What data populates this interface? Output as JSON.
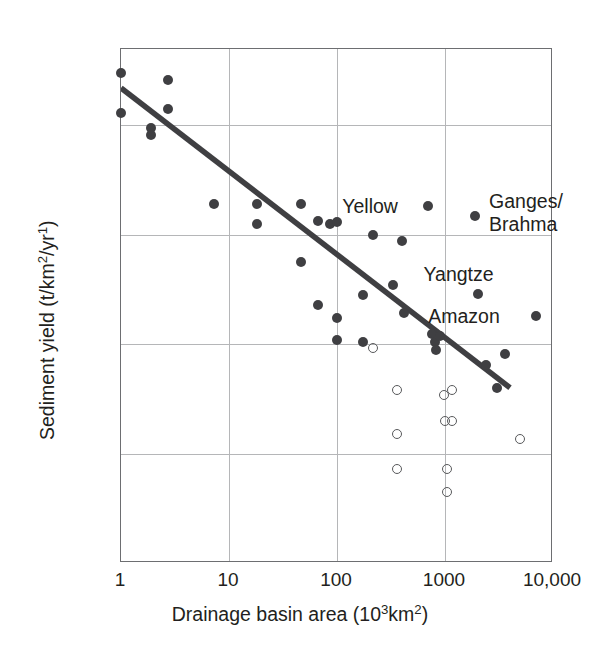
{
  "chart_data": {
    "type": "scatter",
    "title": "",
    "xlabel": "Drainage basin area (10³km²)",
    "ylabel": "Sediment yield (t/km²/yr¹)",
    "xscale": "log",
    "yscale": "log",
    "xlim": [
      1,
      10000
    ],
    "ylim": [
      1,
      50000
    ],
    "grid": true,
    "legend": "none",
    "xticks": [
      {
        "value": 1,
        "label": "1"
      },
      {
        "value": 10,
        "label": "10"
      },
      {
        "value": 100,
        "label": "100"
      },
      {
        "value": 1000,
        "label": "1000"
      },
      {
        "value": 10000,
        "label": "10,000"
      }
    ],
    "yticks": [
      {
        "value": 50000,
        "label": "50,000"
      },
      {
        "value": 10000,
        "label": "10,000"
      },
      {
        "value": 1000,
        "label": "1000"
      },
      {
        "value": 100,
        "label": "100"
      },
      {
        "value": 10,
        "label": "10"
      },
      {
        "value": 1,
        "label": "1"
      }
    ],
    "series": [
      {
        "name": "filled-markers",
        "marker": "filled-circle",
        "color": "#3f3f42",
        "points": [
          {
            "x": 1.0,
            "y": 30000
          },
          {
            "x": 1.0,
            "y": 13000
          },
          {
            "x": 1.9,
            "y": 9400
          },
          {
            "x": 1.9,
            "y": 8200
          },
          {
            "x": 2.7,
            "y": 26000
          },
          {
            "x": 2.7,
            "y": 14000
          },
          {
            "x": 7.2,
            "y": 1900
          },
          {
            "x": 18,
            "y": 1900
          },
          {
            "x": 18,
            "y": 1250
          },
          {
            "x": 46,
            "y": 1900
          },
          {
            "x": 46,
            "y": 560
          },
          {
            "x": 66,
            "y": 1350
          },
          {
            "x": 66,
            "y": 230
          },
          {
            "x": 86,
            "y": 1250
          },
          {
            "x": 100,
            "y": 1300
          },
          {
            "x": 100,
            "y": 175
          },
          {
            "x": 100,
            "y": 110
          },
          {
            "x": 175,
            "y": 280
          },
          {
            "x": 175,
            "y": 105
          },
          {
            "x": 215,
            "y": 1000
          },
          {
            "x": 330,
            "y": 350
          },
          {
            "x": 400,
            "y": 880
          },
          {
            "x": 420,
            "y": 195
          },
          {
            "x": 700,
            "y": 1850
          },
          {
            "x": 760,
            "y": 125
          },
          {
            "x": 800,
            "y": 105
          },
          {
            "x": 830,
            "y": 88
          },
          {
            "x": 900,
            "y": 120
          },
          {
            "x": 1900,
            "y": 1500
          },
          {
            "x": 2000,
            "y": 290
          },
          {
            "x": 2400,
            "y": 65
          },
          {
            "x": 3000,
            "y": 40
          },
          {
            "x": 3600,
            "y": 82
          },
          {
            "x": 7000,
            "y": 180
          }
        ]
      },
      {
        "name": "open-markers",
        "marker": "open-circle",
        "color": "#58595b",
        "points": [
          {
            "x": 215,
            "y": 92
          },
          {
            "x": 360,
            "y": 38
          },
          {
            "x": 360,
            "y": 15
          },
          {
            "x": 360,
            "y": 7.2
          },
          {
            "x": 980,
            "y": 34
          },
          {
            "x": 1150,
            "y": 38
          },
          {
            "x": 1000,
            "y": 20
          },
          {
            "x": 1150,
            "y": 20
          },
          {
            "x": 1050,
            "y": 7.3
          },
          {
            "x": 1050,
            "y": 4.5
          },
          {
            "x": 5000,
            "y": 13.5
          }
        ]
      }
    ],
    "trendline": {
      "name": "regression-line",
      "color": "#3f3f42",
      "from": {
        "x": 1,
        "y": 22000
      },
      "to": {
        "x": 4000,
        "y": 40
      }
    },
    "annotations": [
      {
        "id": "yellow",
        "text": "Yellow",
        "x": 700,
        "y": 1850
      },
      {
        "id": "ganges-brahma",
        "text": "Ganges/",
        "x": 1900,
        "y": 1500
      },
      {
        "id": "brahma",
        "text": "Brahma",
        "x": 1900,
        "y": 1500
      },
      {
        "id": "yangtze",
        "text": "Yangtze",
        "x": 2000,
        "y": 290
      },
      {
        "id": "amazon",
        "text": "Amazon",
        "x": 7000,
        "y": 180
      }
    ]
  },
  "labels": {
    "yellow": "Yellow",
    "ganges": "Ganges/",
    "brahma": "Brahma",
    "yangtze": "Yangtze",
    "amazon": "Amazon"
  },
  "axis": {
    "x_title_main": "Drainage basin area (10",
    "x_title_sup": "3",
    "x_title_tail": "km",
    "x_title_sup2": "2",
    "x_title_close": ")",
    "y_title_main": "Sediment yield (t/km",
    "y_title_sup": "2",
    "y_title_mid": "/yr",
    "y_title_sup2": "1",
    "y_title_close": ")"
  },
  "colors": {
    "marker_filled": "#3f3f42",
    "marker_open": "#58595b",
    "trend": "#3f3f42",
    "grid": "#b5b6b8",
    "frame": "#6d6e71",
    "text": "#231f20"
  }
}
